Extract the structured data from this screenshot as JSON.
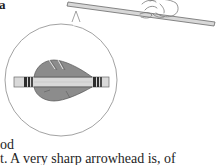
{
  "figure": {
    "label_glyph": "a",
    "colors": {
      "shaft_fill": "#d8d8d8",
      "shaft_outline": "#6a6a6a",
      "feather_fill": "#8c8c8c",
      "feather_outline": "#555555",
      "cresting_band": "#2e2e2e",
      "circle_outline": "#8a8a8a",
      "hand_outline": "#7a7a7a"
    }
  },
  "body_text": {
    "line_1": "od",
    "line_2": "t. A very sharp arrowhead is, of"
  }
}
